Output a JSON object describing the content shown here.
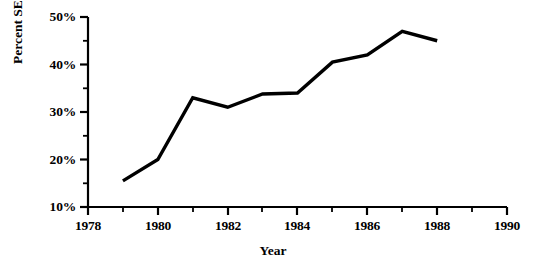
{
  "chart_data": {
    "type": "line",
    "title": "",
    "xlabel": "Year",
    "ylabel": "Percent SEP",
    "x": [
      1979,
      1980,
      1981,
      1982,
      1983,
      1984,
      1985,
      1986,
      1987,
      1988
    ],
    "values": [
      15.5,
      20.0,
      33.0,
      31.0,
      33.8,
      34.0,
      40.5,
      42.0,
      47.0,
      45.0
    ],
    "series": [
      {
        "name": "Percent SEP",
        "values": [
          15.5,
          20.0,
          33.0,
          31.0,
          33.8,
          34.0,
          40.5,
          42.0,
          47.0,
          45.0
        ]
      }
    ],
    "xlim": [
      1978,
      1990
    ],
    "ylim": [
      10,
      50
    ],
    "x_major_ticks": [
      1978,
      1980,
      1982,
      1984,
      1986,
      1988,
      1990
    ],
    "x_minor_ticks": [
      1979,
      1981,
      1983,
      1985,
      1987,
      1989
    ],
    "x_tick_labels": [
      "1978",
      "1980",
      "1982",
      "1984",
      "1986",
      "1988",
      "1990"
    ],
    "y_major_ticks": [
      10,
      20,
      30,
      40,
      50
    ],
    "y_minor_ticks": [
      15,
      25,
      35,
      45
    ],
    "y_tick_labels": [
      "10%",
      "20%",
      "30%",
      "40%",
      "50%"
    ],
    "grid": false,
    "legend": false,
    "line_color": "#000000",
    "axis_color": "#000000",
    "background_color": "#ffffff"
  }
}
